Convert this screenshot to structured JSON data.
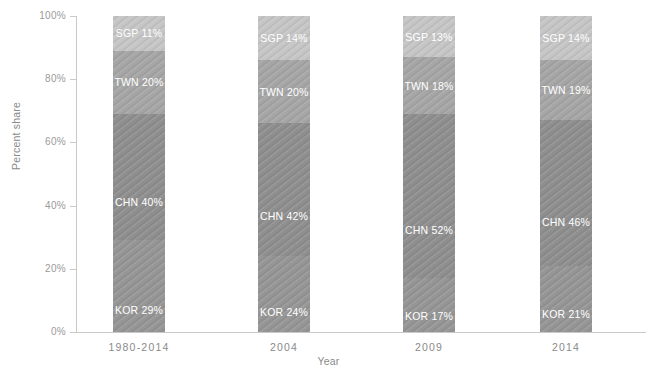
{
  "chart_data": {
    "type": "bar",
    "subtype": "stacked-percent",
    "title": "",
    "xlabel": "Year",
    "ylabel": "Percent share",
    "categories": [
      "1980-2014",
      "2004",
      "2009",
      "2014"
    ],
    "ylim": [
      0,
      100
    ],
    "ytick_labels": [
      "0%",
      "20%",
      "40%",
      "60%",
      "80%",
      "100%"
    ],
    "ytick_values": [
      0,
      20,
      40,
      60,
      80,
      100
    ],
    "grid": false,
    "legend": "none (in-bar data labels)",
    "stack_order_bottom_to_top": [
      "KOR",
      "CHN",
      "TWN",
      "SGP"
    ],
    "series": [
      {
        "name": "KOR",
        "color": "#969696",
        "values": [
          29,
          24,
          17,
          21
        ],
        "labels": [
          "KOR 29%",
          "KOR 24%",
          "KOR 17%",
          "KOR 21%"
        ]
      },
      {
        "name": "CHN",
        "color": "#8f8f8f",
        "values": [
          40,
          42,
          52,
          46
        ],
        "labels": [
          "CHN 40%",
          "CHN 42%",
          "CHN 52%",
          "CHN 46%"
        ]
      },
      {
        "name": "TWN",
        "color": "#a6a6a6",
        "values": [
          20,
          20,
          18,
          19
        ],
        "labels": [
          "TWN 20%",
          "TWN 20%",
          "TWN 18%",
          "TWN 19%"
        ]
      },
      {
        "name": "SGP",
        "color": "#c6c6c6",
        "values": [
          11,
          14,
          13,
          14
        ],
        "labels": [
          "SGP 11%",
          "SGP 14%",
          "SGP 13%",
          "SGP 14%"
        ]
      }
    ]
  },
  "axis": {
    "y_title": "Percent share",
    "x_title": "Year",
    "tick_color": "#9a9a9a",
    "spine_color": "#c9c9c9"
  },
  "ticks": {
    "y": [
      {
        "label": "100%",
        "value": 100
      },
      {
        "label": "80%",
        "value": 80
      },
      {
        "label": "60%",
        "value": 60
      },
      {
        "label": "40%",
        "value": 40
      },
      {
        "label": "20%",
        "value": 20
      },
      {
        "label": "0%",
        "value": 0
      }
    ],
    "x": [
      {
        "label": "1980-2014"
      },
      {
        "label": "2004"
      },
      {
        "label": "2009"
      },
      {
        "label": "2014"
      }
    ]
  },
  "bars": [
    {
      "category": "1980-2014",
      "segments": [
        {
          "series": "SGP",
          "label": "SGP 11%",
          "value": 11
        },
        {
          "series": "TWN",
          "label": "TWN 20%",
          "value": 20
        },
        {
          "series": "CHN",
          "label": "CHN 40%",
          "value": 40
        },
        {
          "series": "KOR",
          "label": "KOR 29%",
          "value": 29
        }
      ]
    },
    {
      "category": "2004",
      "segments": [
        {
          "series": "SGP",
          "label": "SGP 14%",
          "value": 14
        },
        {
          "series": "TWN",
          "label": "TWN 20%",
          "value": 20
        },
        {
          "series": "CHN",
          "label": "CHN 42%",
          "value": 42
        },
        {
          "series": "KOR",
          "label": "KOR 24%",
          "value": 24
        }
      ]
    },
    {
      "category": "2009",
      "segments": [
        {
          "series": "SGP",
          "label": "SGP 13%",
          "value": 13
        },
        {
          "series": "TWN",
          "label": "TWN 18%",
          "value": 18
        },
        {
          "series": "CHN",
          "label": "CHN 52%",
          "value": 52
        },
        {
          "series": "KOR",
          "label": "KOR 17%",
          "value": 17
        }
      ]
    },
    {
      "category": "2014",
      "segments": [
        {
          "series": "SGP",
          "label": "SGP 14%",
          "value": 14
        },
        {
          "series": "TWN",
          "label": "TWN 19%",
          "value": 19
        },
        {
          "series": "CHN",
          "label": "CHN 46%",
          "value": 46
        },
        {
          "series": "KOR",
          "label": "KOR 21%",
          "value": 21
        }
      ]
    }
  ]
}
